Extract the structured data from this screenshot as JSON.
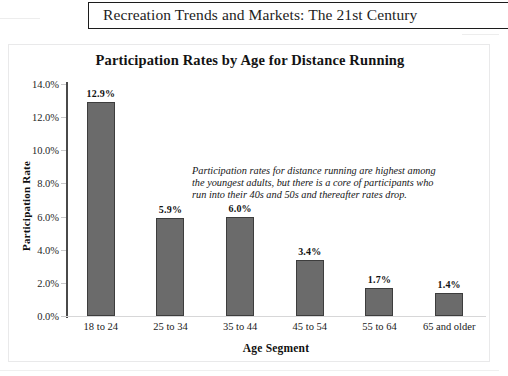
{
  "page_header": {
    "title": "Recreation Trends and Markets: The 21st Century"
  },
  "chart_data": {
    "type": "bar",
    "title": "Participation Rates by Age for Distance Running",
    "xlabel": "Age Segment",
    "ylabel": "Participation Rate",
    "categories": [
      "18 to 24",
      "25 to 34",
      "35 to 44",
      "45 to 54",
      "55 to 64",
      "65 and older"
    ],
    "values": [
      12.9,
      5.9,
      6.0,
      3.4,
      1.7,
      1.4
    ],
    "value_labels": [
      "12.9%",
      "5.9%",
      "6.0%",
      "3.4%",
      "1.7%",
      "1.4%"
    ],
    "ylim": [
      0,
      14
    ],
    "ytick_labels": [
      "14.0%",
      "12.0%",
      "10.0%",
      "8.0%",
      "6.0%",
      "4.0%",
      "2.0%",
      "0.0%"
    ],
    "ytick_values": [
      14,
      12,
      10,
      8,
      6,
      4,
      2,
      0
    ],
    "grid": false,
    "legend": "none",
    "bar_color": "#6b6b6b",
    "bar_edge_color": "#3d3d3d",
    "annotation": "Participation rates for distance running are highest among the youngest adults, but there is a core of participants who run into their 40s and 50s and thereafter rates drop."
  }
}
